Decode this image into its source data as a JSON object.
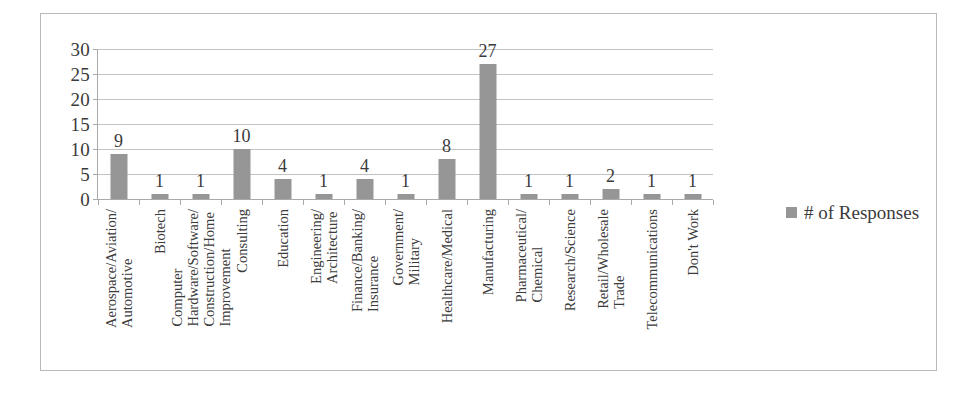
{
  "chart_data": {
    "type": "bar",
    "title": "",
    "subtitle": "",
    "xlabel": "",
    "ylabel": "",
    "ylim": [
      0,
      30
    ],
    "ytick_step": 5,
    "yticks": [
      "0",
      "5",
      "10",
      "15",
      "20",
      "25",
      "30"
    ],
    "grid": true,
    "grid_axis": "y",
    "legend_position": "right",
    "bar_color": "#969696",
    "grid_color": "#c3c3c3",
    "axis_color": "#a9a9a9",
    "frame_color": "#b9b9b9",
    "show_data_labels": true,
    "categories": [
      "Aerospace/Aviation/ Automotive",
      "Biotech",
      "Computer Hardware/Software/ Construction/Home Improvement",
      "Consulting",
      "Education",
      "Engineering/ Architecture",
      "Finance/Banking/ Insurance",
      "Government/ Military",
      "Healthcare/Medical",
      "Manufacturing",
      "Pharmaceutical/ Chemical",
      "Research/Science",
      "Retail/Wholesale Trade",
      "Telecommunications",
      "Don't Work"
    ],
    "category_lines": [
      [
        "Aerospace/Aviation/",
        "Automotive"
      ],
      [
        "Biotech"
      ],
      [
        "Computer",
        "Hardware/Software/",
        "Construction/Home",
        "Improvement"
      ],
      [
        "Consulting"
      ],
      [
        "Education"
      ],
      [
        "Engineering/",
        "Architecture"
      ],
      [
        "Finance/Banking/",
        "Insurance"
      ],
      [
        "Government/",
        "Military"
      ],
      [
        "Healthcare/Medical"
      ],
      [
        "Manufacturing"
      ],
      [
        "Pharmaceutical/",
        "Chemical"
      ],
      [
        "Research/Science"
      ],
      [
        "Retail/Wholesale",
        "Trade"
      ],
      [
        "Telecommunications"
      ],
      [
        "Don't Work"
      ]
    ],
    "values": [
      9,
      1,
      1,
      10,
      4,
      1,
      4,
      1,
      8,
      27,
      1,
      1,
      2,
      1,
      1
    ],
    "series": [
      {
        "name": "# of Responses",
        "values": [
          9,
          1,
          1,
          10,
          4,
          1,
          4,
          1,
          8,
          27,
          1,
          1,
          2,
          1,
          1
        ]
      }
    ]
  },
  "legend": {
    "entries": [
      {
        "label": "# of Responses",
        "color": "#969696"
      }
    ]
  }
}
